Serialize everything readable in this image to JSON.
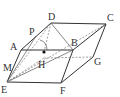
{
  "diagram": {
    "type": "parallelepiped-geometry-figure",
    "points": {
      "A": {
        "label": "A",
        "x": 21,
        "y": 50,
        "lx": 10,
        "ly": 50
      },
      "B": {
        "label": "B",
        "x": 73,
        "y": 50,
        "lx": 71,
        "ly": 46
      },
      "C": {
        "label": "C",
        "x": 106,
        "y": 24,
        "lx": 107,
        "ly": 21
      },
      "D": {
        "label": "D",
        "x": 51,
        "y": 23,
        "lx": 48,
        "ly": 20
      },
      "E": {
        "label": "E",
        "x": 7,
        "y": 82,
        "lx": 1,
        "ly": 93
      },
      "F": {
        "label": "F",
        "x": 61,
        "y": 83,
        "lx": 60,
        "ly": 94
      },
      "G": {
        "label": "G",
        "x": 93,
        "y": 57,
        "lx": 94,
        "ly": 65
      },
      "M": {
        "label": "M",
        "x": 14,
        "y": 66,
        "lx": 3,
        "ly": 71
      },
      "P": {
        "label": "P",
        "x": 36,
        "y": 36,
        "lx": 29,
        "ly": 35
      },
      "H": {
        "label": "H",
        "x": 44,
        "y": 52,
        "lx": 38,
        "ly": 68
      }
    },
    "solid_edges": [
      [
        "A",
        "D"
      ],
      [
        "D",
        "C"
      ],
      [
        "A",
        "B"
      ],
      [
        "B",
        "C"
      ],
      [
        "A",
        "E"
      ],
      [
        "E",
        "F"
      ],
      [
        "F",
        "B"
      ],
      [
        "F",
        "G"
      ],
      [
        "G",
        "C"
      ],
      [
        "D",
        "B"
      ],
      [
        "E",
        "B"
      ],
      [
        "E",
        "P"
      ]
    ],
    "dashed_edges": [
      [
        "E",
        "C"
      ],
      [
        "E",
        "D"
      ],
      [
        "D",
        "H"
      ],
      [
        "H",
        "G"
      ],
      [
        "E",
        "H"
      ]
    ],
    "angle_mark": {
      "at": "H",
      "desc": "arc marking angle between DH and plane"
    },
    "dot": {
      "at": "H"
    }
  }
}
